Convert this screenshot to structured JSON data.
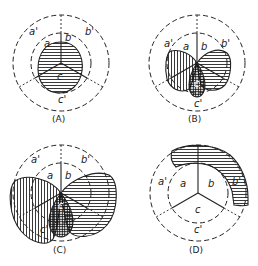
{
  "figure": {
    "panels": [
      {
        "id": "A",
        "caption": "(A)",
        "labels": {
          "a_prime": "a'",
          "a": "a",
          "b": "b",
          "b_prime": "b'",
          "c": "c",
          "c_prime": "c'"
        },
        "description": "Single rounded horizontally-hatched region covering inner sectors a, b and c around center"
      },
      {
        "id": "B",
        "caption": "(B)",
        "labels": {
          "a_prime": "a'",
          "a": "a",
          "b": "b",
          "b_prime": "b'",
          "c": "c",
          "c_prime": "c'"
        },
        "description": "Three lobes: vertically-hatched lobe over a, horizontally-hatched lobe over b, cross-hatched narrow lobe over c"
      },
      {
        "id": "C",
        "caption": "(C)",
        "labels": {
          "a_prime": "a'",
          "a": "a",
          "b": "b",
          "b_prime": "b'",
          "c": "c",
          "c_prime": "c'"
        },
        "description": "Large vertically-hatched lobe extending into a', large horizontally-hatched lobe extending into b', cross-hatched lobe over c"
      },
      {
        "id": "D",
        "caption": "(D)",
        "labels": {
          "a_prime": "a'",
          "a": "a",
          "b": "b",
          "b_prime": "b'",
          "c": "c",
          "c_prime": "c'"
        },
        "description": "Horizontally-hatched crescent in outer ring from top down into b'"
      }
    ]
  }
}
